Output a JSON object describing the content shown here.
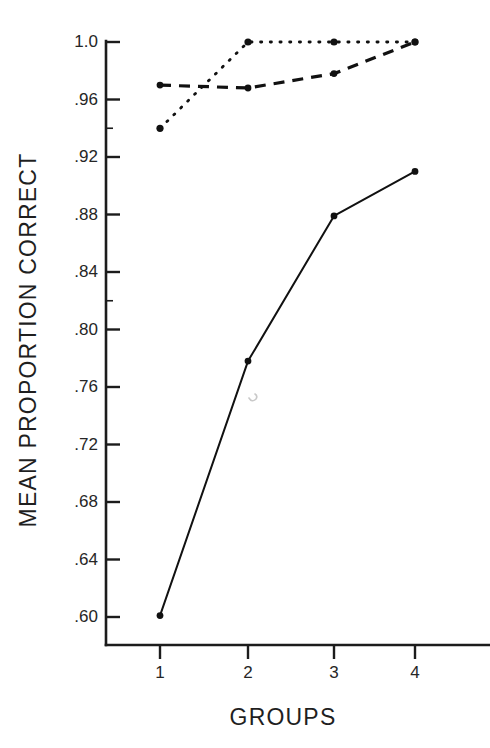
{
  "chart_data": {
    "type": "line",
    "title": "",
    "subtitle": "",
    "xlabel": "GROUPS",
    "ylabel": "MEAN PROPORTION CORRECT",
    "categories": [
      "1",
      "2",
      "3",
      "4"
    ],
    "x": [
      1,
      2,
      3,
      4
    ],
    "xlim": [
      0.6,
      4.6
    ],
    "ylim": [
      0.58,
      1.0
    ],
    "yticks": [
      0.6,
      0.64,
      0.68,
      0.72,
      0.76,
      0.8,
      0.84,
      0.88,
      0.92,
      0.96,
      1.0
    ],
    "ytick_labels": [
      ".60",
      ".64",
      ".68",
      ".72",
      ".76",
      ".80",
      ".84",
      ".88",
      ".92",
      ".96",
      "1.0"
    ],
    "xticks": [
      1,
      2,
      3,
      4
    ],
    "xtick_labels": [
      "1",
      "2",
      "3",
      "4"
    ],
    "grid": false,
    "legend": "none",
    "legend_position": "none",
    "marker": "filled-circle",
    "series": [
      {
        "name": "solid",
        "style": "solid",
        "values": [
          0.601,
          0.778,
          0.879,
          0.91
        ]
      },
      {
        "name": "dashed",
        "style": "dashed",
        "values": [
          0.97,
          0.968,
          0.978,
          1.0
        ]
      },
      {
        "name": "dotted",
        "style": "dotted",
        "values": [
          0.94,
          1.0,
          1.0,
          1.0
        ]
      }
    ],
    "colors": {
      "ink": "#111111",
      "axis": "#1c1c1c",
      "text": "#262626",
      "background": "#ffffff"
    }
  },
  "axes": {
    "y_label_text": "MEAN PROPORTION CORRECT",
    "x_label_text": "GROUPS"
  }
}
